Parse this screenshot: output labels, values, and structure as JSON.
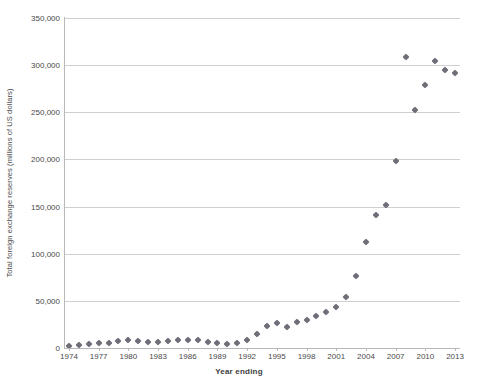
{
  "chart_data": {
    "type": "scatter",
    "title": "",
    "xlabel": "Year ending",
    "ylabel": "Total foreign exchange reserves (millions of US dollars)",
    "xlim": [
      1973.5,
      2013.5
    ],
    "ylim": [
      0,
      350000
    ],
    "grid": true,
    "legend": false,
    "marker": "diamond",
    "marker_color": "#6e6e78",
    "y_ticks": [
      0,
      50000,
      100000,
      150000,
      200000,
      250000,
      300000,
      350000
    ],
    "y_tick_labels": [
      "0",
      "50,000",
      "100,000",
      "150,000",
      "200,000",
      "250,000",
      "300,000",
      "350,000"
    ],
    "x_ticks": [
      1974,
      1977,
      1980,
      1983,
      1986,
      1989,
      1992,
      1995,
      1998,
      2001,
      2004,
      2007,
      2010,
      2013
    ],
    "x_tick_labels": [
      "1974",
      "1977",
      "1980",
      "1983",
      "1986",
      "1989",
      "1992",
      "1995",
      "1998",
      "2001",
      "2004",
      "2007",
      "2010",
      "2013"
    ],
    "x": [
      1974,
      1975,
      1976,
      1977,
      1978,
      1979,
      1980,
      1981,
      1982,
      1983,
      1984,
      1985,
      1986,
      1987,
      1988,
      1989,
      1990,
      1991,
      1992,
      1993,
      1994,
      1995,
      1996,
      1997,
      1998,
      1999,
      2000,
      2001,
      2002,
      2003,
      2004,
      2005,
      2006,
      2007,
      2008,
      2009,
      2010,
      2011,
      2012,
      2013
    ],
    "values": [
      2500,
      3000,
      3800,
      5000,
      5800,
      7200,
      8200,
      7800,
      6500,
      6800,
      7500,
      8000,
      8400,
      8000,
      6800,
      5500,
      4500,
      5500,
      8900,
      15000,
      23000,
      26000,
      22500,
      27500,
      30000,
      33500,
      38500,
      43000,
      54000,
      76000,
      112000,
      141000,
      152000,
      198000,
      309000,
      252000,
      279000,
      304000,
      295000,
      292000
    ],
    "series_name": "Total foreign exchange reserves"
  },
  "axis": {
    "y_title": "Total foreign exchange reserves (millions of US dollars)",
    "x_title": "Year ending"
  }
}
